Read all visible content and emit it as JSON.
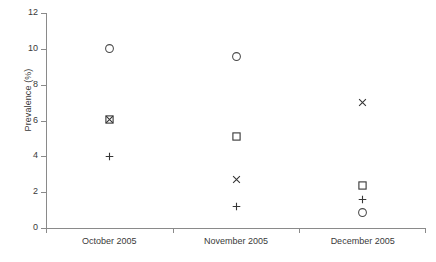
{
  "chart_data": {
    "type": "scatter",
    "title": "",
    "xlabel": "",
    "ylabel": "Prevalence (%)",
    "categories": [
      "October 2005",
      "November 2005",
      "December 2005"
    ],
    "ylim": [
      0,
      12
    ],
    "yticks": [
      0,
      2,
      4,
      6,
      8,
      10,
      12
    ],
    "grid": false,
    "legend": "none",
    "series": [
      {
        "name": "circle",
        "marker": "circle-open",
        "values": [
          10.0,
          9.6,
          0.85
        ]
      },
      {
        "name": "square",
        "marker": "square-open",
        "values": [
          6.05,
          5.1,
          2.4
        ]
      },
      {
        "name": "cross",
        "marker": "x-cross",
        "values": [
          6.05,
          2.7,
          7.0
        ]
      },
      {
        "name": "plus",
        "marker": "plus",
        "values": [
          4.0,
          1.2,
          1.6
        ]
      }
    ],
    "points": [
      {
        "category_index": 0,
        "series": "circle",
        "value": 10.0
      },
      {
        "category_index": 0,
        "series": "square",
        "value": 6.05
      },
      {
        "category_index": 0,
        "series": "cross",
        "value": 6.05
      },
      {
        "category_index": 0,
        "series": "plus",
        "value": 4.0
      },
      {
        "category_index": 1,
        "series": "circle",
        "value": 9.6
      },
      {
        "category_index": 1,
        "series": "square",
        "value": 5.1
      },
      {
        "category_index": 1,
        "series": "cross",
        "value": 2.7
      },
      {
        "category_index": 1,
        "series": "plus",
        "value": 1.2
      },
      {
        "category_index": 2,
        "series": "cross",
        "value": 7.0
      },
      {
        "category_index": 2,
        "series": "square",
        "value": 2.4
      },
      {
        "category_index": 2,
        "series": "plus",
        "value": 1.6
      },
      {
        "category_index": 2,
        "series": "circle",
        "value": 0.85
      }
    ],
    "colors": {
      "marker": "#363636",
      "axis": "#8a8a8a",
      "text": "#3a3a3a",
      "background": "#ffffff"
    }
  }
}
